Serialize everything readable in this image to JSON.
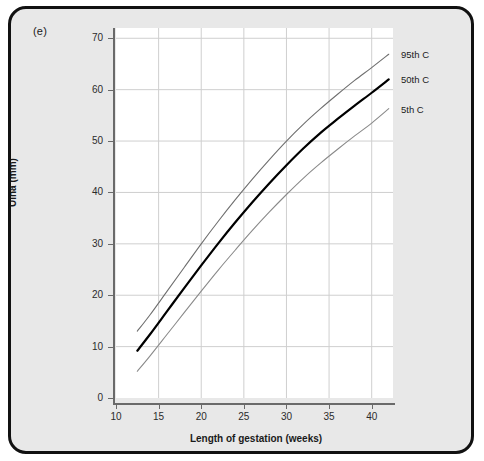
{
  "figure": {
    "panel_label": "(e)",
    "background_color": "#e8e8e8",
    "border_color": "#111111",
    "plot_background": "#ffffff"
  },
  "chart_data": {
    "type": "line",
    "title": "",
    "subtitle": "",
    "xlabel": "Length of gestation (weeks)",
    "ylabel": "Ulna (mm)",
    "xlim": [
      10,
      42.5
    ],
    "ylim": [
      0,
      72
    ],
    "xticks": [
      10,
      15,
      20,
      25,
      30,
      35,
      40
    ],
    "yticks": [
      0,
      10,
      20,
      30,
      40,
      50,
      60,
      70
    ],
    "xtick_labels": [
      "10",
      "15",
      "20",
      "25",
      "30",
      "35",
      "40"
    ],
    "ytick_labels": [
      "0",
      "10",
      "20",
      "30",
      "40",
      "50",
      "60",
      "70"
    ],
    "grid": true,
    "grid_color": "#cfcfcf",
    "legend_position": "right-outside",
    "x": [
      12.5,
      14,
      16,
      18,
      20,
      22,
      24,
      26,
      28,
      30,
      32,
      34,
      36,
      38,
      40,
      42
    ],
    "series": [
      {
        "name": "95th C",
        "label": "95th C",
        "color": "#6f6f6f",
        "width": 1.1,
        "values": [
          13.0,
          16.2,
          20.8,
          25.4,
          30.0,
          34.4,
          38.6,
          42.6,
          46.4,
          50.0,
          53.3,
          56.3,
          59.1,
          61.8,
          64.3,
          66.9
        ]
      },
      {
        "name": "50th C",
        "label": "50th C",
        "color": "#000000",
        "width": 2.2,
        "values": [
          9.2,
          12.4,
          16.9,
          21.4,
          25.8,
          30.1,
          34.2,
          38.1,
          41.8,
          45.3,
          48.6,
          51.6,
          54.3,
          56.9,
          59.4,
          62.0
        ]
      },
      {
        "name": "5th C",
        "label": "5th C",
        "color": "#8a8a8a",
        "width": 1.1,
        "values": [
          5.2,
          8.2,
          12.4,
          16.6,
          20.8,
          24.9,
          28.8,
          32.6,
          36.2,
          39.6,
          42.8,
          45.7,
          48.4,
          51.0,
          53.5,
          56.3
        ]
      }
    ],
    "legend_entries": [
      {
        "label": "95th C"
      },
      {
        "label": "50th C"
      },
      {
        "label": "5th C"
      }
    ]
  }
}
